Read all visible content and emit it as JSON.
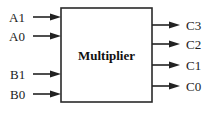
{
  "diagram": {
    "block": {
      "label": "Multiplier",
      "x": 61,
      "y": 8,
      "width": 91,
      "height": 94
    },
    "inputs": [
      {
        "label": "A1",
        "y": 17
      },
      {
        "label": "A0",
        "y": 36
      },
      {
        "label": "B1",
        "y": 74
      },
      {
        "label": "B0",
        "y": 94
      }
    ],
    "outputs": [
      {
        "label": "C3",
        "y": 25
      },
      {
        "label": "C2",
        "y": 44
      },
      {
        "label": "C1",
        "y": 65
      },
      {
        "label": "C0",
        "y": 86
      }
    ],
    "colors": {
      "line": "#222222",
      "background": "#ffffff"
    }
  }
}
